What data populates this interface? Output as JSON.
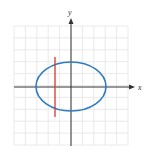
{
  "figure": {
    "type": "vertical-line-test",
    "axes": {
      "x_label": "x",
      "y_label": "y"
    },
    "grid": {
      "cells_x": 10,
      "cells_y": 10,
      "color": "#e6e6e6"
    },
    "curve": {
      "shape": "ellipse",
      "color": "#2f7bbf"
    },
    "test_line": {
      "orientation": "vertical",
      "color": "#d9362b"
    },
    "axis_color": "#333333"
  }
}
